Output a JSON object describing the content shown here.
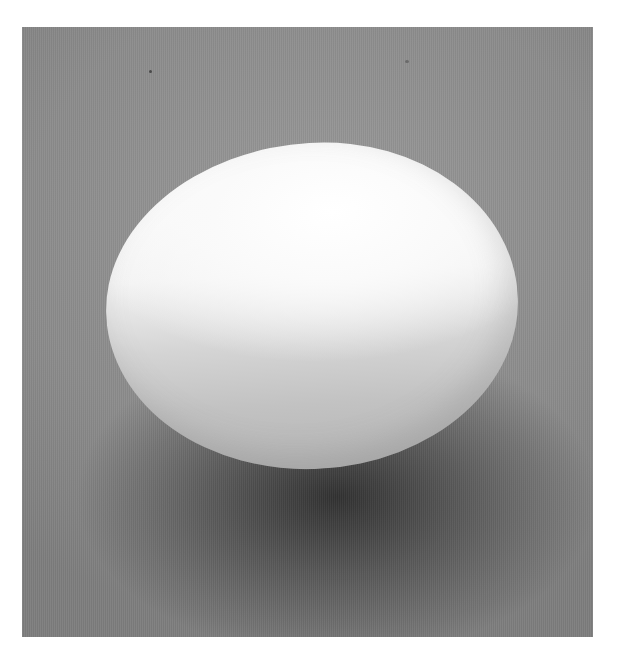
{
  "image": {
    "subject": "white egg on gray textured surface",
    "colors": {
      "border": "#ffffff",
      "background": "#8e8e8e",
      "egg_highlight": "#ffffff",
      "egg_shadow_side": "#b8b8b8",
      "cast_shadow": "#2a2a2a"
    }
  }
}
